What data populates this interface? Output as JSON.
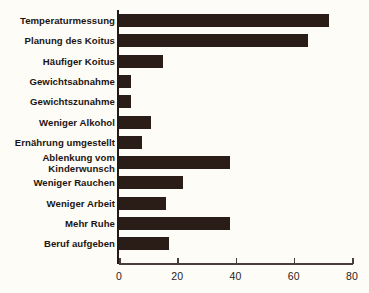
{
  "chart_data": {
    "type": "bar",
    "orientation": "horizontal",
    "title": "",
    "xlabel": "",
    "ylabel": "",
    "xlim": [
      0,
      80
    ],
    "xticks": [
      0,
      20,
      40,
      60,
      80
    ],
    "xtick_labels": [
      "0",
      "20",
      "40",
      "60",
      "80"
    ],
    "grid": false,
    "legend": null,
    "bar_color": "#2a1d18",
    "background_color": "#fdfcf7",
    "categories": [
      "Temperaturmessung",
      "Planung des Koitus",
      "Häufiger Koitus",
      "Gewichtsabnahme",
      "Gewichtszunahme",
      "Weniger Alkohol",
      "Ernährung umgestellt",
      "Ablenkung vom\nKinderwunsch",
      "Weniger Rauchen",
      "Weniger Arbeit",
      "Mehr Ruhe",
      "Beruf aufgeben"
    ],
    "values": [
      72,
      65,
      15,
      4,
      4,
      11,
      8,
      38,
      22,
      16,
      38,
      17
    ]
  }
}
